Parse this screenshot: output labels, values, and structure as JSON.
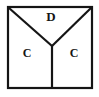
{
  "figure": {
    "name": "square-with-y-partition",
    "background_color": "#ffffff",
    "stroke_color": "#151515",
    "label_color": "#151515"
  },
  "square": {
    "name": "outer-square",
    "x": 8,
    "y": 7,
    "width": 84,
    "height": 81,
    "stroke_width": 2.2
  },
  "partition": {
    "name": "y-shaped-partition",
    "stroke_width": 2.2,
    "vertex": {
      "x": 52,
      "y": 46
    },
    "branches": [
      {
        "name": "left-diagonal",
        "x1": 9,
        "y1": 8,
        "x2": 52,
        "y2": 46
      },
      {
        "name": "right-diagonal",
        "x1": 91,
        "y1": 8,
        "x2": 52,
        "y2": 46
      },
      {
        "name": "vertical-stem",
        "x1": 52,
        "y1": 46,
        "x2": 52,
        "y2": 87
      }
    ]
  },
  "labels": [
    {
      "name": "label-d-top-region",
      "text": "D",
      "x": 51,
      "y": 18,
      "font_size": 13
    },
    {
      "name": "label-c-left-region",
      "text": "C",
      "x": 27,
      "y": 54,
      "font_size": 12
    },
    {
      "name": "label-c-right-region",
      "text": "C",
      "x": 74,
      "y": 54,
      "font_size": 12
    }
  ]
}
